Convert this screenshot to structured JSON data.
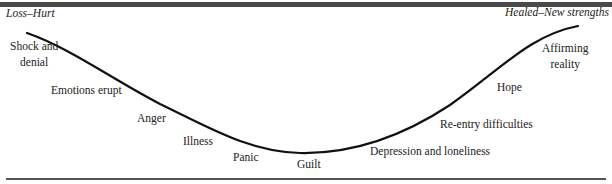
{
  "diagram": {
    "type": "grief-recovery-curve",
    "start_label": "Loss–Hurt",
    "end_label": "Healed–New strengths",
    "stages": [
      {
        "label_line1": "Shock and",
        "label_line2": "denial"
      },
      {
        "label": "Emotions erupt"
      },
      {
        "label": "Anger"
      },
      {
        "label": "Illness"
      },
      {
        "label": "Panic"
      },
      {
        "label": "Guilt"
      },
      {
        "label": "Depression and loneliness"
      },
      {
        "label": "Re-entry difficulties"
      },
      {
        "label": "Hope"
      },
      {
        "label_line1": "Affirming",
        "label_line2": "reality"
      }
    ],
    "colors": {
      "curve": "#111111",
      "rule": "#4a4a4a",
      "text": "#222222"
    }
  }
}
